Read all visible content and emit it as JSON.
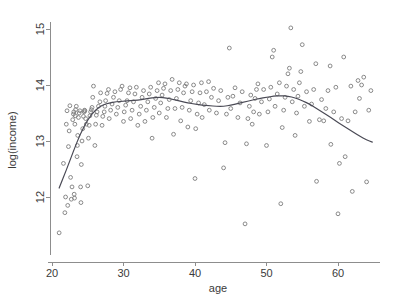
{
  "chart_data": {
    "type": "scatter",
    "title": "",
    "subtitle": "",
    "xlabel": "age",
    "ylabel": "log(income)",
    "xlim": [
      20,
      65
    ],
    "ylim": [
      11.3,
      15.2
    ],
    "xticks": [
      20,
      30,
      40,
      50,
      60
    ],
    "yticks": [
      12,
      13,
      14,
      15
    ],
    "xtick_labels": [
      "20",
      "30",
      "40",
      "50",
      "60"
    ],
    "ytick_labels": [
      "12",
      "13",
      "14",
      "15"
    ],
    "grid": false,
    "legend": null,
    "legend_position": "none",
    "marker": "open-circle",
    "marker_color": "#7d7d7d",
    "curve_color": "#4a4a55",
    "axis_color": "#8d8d8d",
    "background_color": "#ffffff",
    "annotations": [],
    "series": [
      {
        "name": "observations",
        "type": "scatter",
        "points": [
          [
            21.0,
            11.36
          ],
          [
            21.6,
            12.6
          ],
          [
            21.8,
            11.72
          ],
          [
            21.9,
            12.0
          ],
          [
            22.0,
            13.3
          ],
          [
            22.1,
            13.54
          ],
          [
            22.2,
            11.85
          ],
          [
            22.3,
            12.9
          ],
          [
            22.4,
            13.18
          ],
          [
            22.5,
            13.63
          ],
          [
            22.6,
            12.35
          ],
          [
            22.7,
            11.96
          ],
          [
            22.8,
            12.18
          ],
          [
            22.9,
            13.38
          ],
          [
            23.0,
            13.48
          ],
          [
            23.05,
            13.52
          ],
          [
            23.1,
            12.05
          ],
          [
            23.15,
            11.98
          ],
          [
            23.2,
            13.3
          ],
          [
            23.25,
            13.45
          ],
          [
            23.3,
            13.56
          ],
          [
            23.4,
            13.62
          ],
          [
            23.5,
            12.72
          ],
          [
            23.55,
            12.92
          ],
          [
            23.6,
            13.1
          ],
          [
            23.7,
            13.42
          ],
          [
            23.8,
            13.5
          ],
          [
            23.9,
            13.54
          ],
          [
            24.0,
            12.18
          ],
          [
            24.05,
            11.9
          ],
          [
            24.1,
            12.58
          ],
          [
            24.2,
            13.0
          ],
          [
            24.3,
            13.22
          ],
          [
            24.4,
            13.44
          ],
          [
            24.5,
            13.52
          ],
          [
            24.55,
            13.55
          ],
          [
            24.6,
            13.54
          ],
          [
            24.7,
            13.4
          ],
          [
            24.8,
            13.3
          ],
          [
            25.0,
            12.2
          ],
          [
            25.1,
            13.05
          ],
          [
            25.2,
            13.28
          ],
          [
            25.3,
            13.45
          ],
          [
            25.4,
            13.52
          ],
          [
            25.5,
            13.56
          ],
          [
            25.6,
            13.6
          ],
          [
            25.7,
            13.78
          ],
          [
            25.8,
            13.98
          ],
          [
            26.0,
            12.92
          ],
          [
            26.1,
            13.3
          ],
          [
            26.2,
            13.46
          ],
          [
            26.3,
            13.52
          ],
          [
            26.5,
            13.62
          ],
          [
            26.7,
            13.7
          ],
          [
            26.8,
            13.86
          ],
          [
            27.0,
            13.28
          ],
          [
            27.1,
            13.44
          ],
          [
            27.3,
            13.52
          ],
          [
            27.4,
            13.62
          ],
          [
            27.5,
            13.72
          ],
          [
            27.7,
            13.85
          ],
          [
            27.9,
            13.92
          ],
          [
            28.0,
            13.4
          ],
          [
            28.2,
            13.55
          ],
          [
            28.4,
            13.66
          ],
          [
            28.6,
            13.78
          ],
          [
            28.8,
            13.88
          ],
          [
            29.0,
            13.48
          ],
          [
            29.2,
            13.6
          ],
          [
            29.4,
            13.72
          ],
          [
            29.6,
            13.92
          ],
          [
            29.8,
            13.98
          ],
          [
            30.0,
            13.35
          ],
          [
            30.1,
            13.52
          ],
          [
            30.3,
            13.64
          ],
          [
            30.5,
            13.72
          ],
          [
            30.7,
            13.86
          ],
          [
            30.9,
            13.95
          ],
          [
            31.0,
            13.4
          ],
          [
            31.2,
            13.55
          ],
          [
            31.4,
            13.7
          ],
          [
            31.6,
            13.84
          ],
          [
            31.8,
            13.96
          ],
          [
            32.0,
            13.28
          ],
          [
            32.2,
            13.48
          ],
          [
            32.4,
            13.62
          ],
          [
            32.6,
            13.78
          ],
          [
            32.8,
            13.9
          ],
          [
            33.0,
            13.35
          ],
          [
            33.2,
            13.55
          ],
          [
            33.4,
            13.7
          ],
          [
            33.6,
            13.84
          ],
          [
            33.8,
            13.96
          ],
          [
            34.0,
            13.05
          ],
          [
            34.1,
            13.42
          ],
          [
            34.3,
            13.6
          ],
          [
            34.5,
            13.76
          ],
          [
            34.7,
            13.9
          ],
          [
            34.9,
            14.04
          ],
          [
            35.0,
            13.5
          ],
          [
            35.2,
            13.68
          ],
          [
            35.4,
            13.82
          ],
          [
            35.6,
            13.94
          ],
          [
            35.8,
            14.02
          ],
          [
            36.0,
            13.42
          ],
          [
            36.2,
            13.58
          ],
          [
            36.4,
            13.74
          ],
          [
            36.6,
            13.9
          ],
          [
            36.8,
            14.1
          ],
          [
            37.0,
            13.12
          ],
          [
            37.2,
            13.58
          ],
          [
            37.4,
            13.76
          ],
          [
            37.6,
            13.92
          ],
          [
            37.8,
            14.04
          ],
          [
            38.0,
            13.36
          ],
          [
            38.2,
            13.6
          ],
          [
            38.4,
            13.86
          ],
          [
            38.6,
            13.98
          ],
          [
            38.8,
            14.02
          ],
          [
            39.0,
            13.25
          ],
          [
            39.2,
            13.55
          ],
          [
            39.4,
            13.72
          ],
          [
            39.6,
            13.88
          ],
          [
            39.8,
            14.0
          ],
          [
            40.0,
            12.33
          ],
          [
            40.1,
            13.22
          ],
          [
            40.3,
            13.48
          ],
          [
            40.5,
            13.68
          ],
          [
            40.7,
            13.86
          ],
          [
            40.9,
            14.04
          ],
          [
            41.0,
            13.42
          ],
          [
            41.3,
            13.65
          ],
          [
            41.6,
            13.88
          ],
          [
            41.9,
            14.06
          ],
          [
            42.0,
            13.55
          ],
          [
            42.3,
            13.78
          ],
          [
            42.6,
            13.94
          ],
          [
            43.0,
            13.5
          ],
          [
            43.3,
            13.72
          ],
          [
            43.6,
            13.9
          ],
          [
            44.0,
            12.52
          ],
          [
            44.2,
            12.97
          ],
          [
            44.4,
            13.48
          ],
          [
            44.6,
            13.78
          ],
          [
            44.8,
            14.66
          ],
          [
            45.0,
            13.58
          ],
          [
            45.3,
            13.8
          ],
          [
            45.6,
            13.95
          ],
          [
            46.0,
            13.42
          ],
          [
            46.3,
            13.68
          ],
          [
            46.6,
            13.88
          ],
          [
            47.0,
            11.52
          ],
          [
            47.2,
            12.95
          ],
          [
            47.4,
            13.4
          ],
          [
            47.6,
            13.62
          ],
          [
            47.8,
            13.82
          ],
          [
            48.0,
            13.3
          ],
          [
            48.2,
            13.52
          ],
          [
            48.4,
            13.76
          ],
          [
            48.6,
            13.92
          ],
          [
            48.8,
            14.02
          ],
          [
            49.0,
            13.48
          ],
          [
            49.3,
            13.7
          ],
          [
            49.6,
            13.92
          ],
          [
            50.0,
            12.92
          ],
          [
            50.2,
            13.52
          ],
          [
            50.4,
            13.75
          ],
          [
            50.6,
            13.96
          ],
          [
            50.8,
            14.5
          ],
          [
            51.0,
            14.62
          ],
          [
            51.2,
            13.62
          ],
          [
            51.5,
            13.84
          ],
          [
            51.8,
            14.04
          ],
          [
            52.0,
            11.88
          ],
          [
            52.2,
            13.24
          ],
          [
            52.4,
            13.55
          ],
          [
            52.6,
            13.78
          ],
          [
            52.8,
            13.98
          ],
          [
            53.0,
            14.2
          ],
          [
            53.2,
            14.3
          ],
          [
            53.4,
            15.02
          ],
          [
            53.6,
            13.7
          ],
          [
            53.8,
            13.92
          ],
          [
            54.0,
            13.1
          ],
          [
            54.2,
            13.5
          ],
          [
            54.4,
            13.8
          ],
          [
            54.6,
            14.04
          ],
          [
            54.8,
            14.24
          ],
          [
            55.0,
            14.72
          ],
          [
            55.3,
            13.62
          ],
          [
            55.6,
            13.88
          ],
          [
            56.0,
            13.35
          ],
          [
            56.3,
            13.66
          ],
          [
            56.6,
            13.92
          ],
          [
            56.9,
            14.38
          ],
          [
            57.0,
            12.28
          ],
          [
            57.4,
            13.38
          ],
          [
            57.7,
            13.74
          ],
          [
            58.0,
            13.36
          ],
          [
            58.3,
            13.58
          ],
          [
            58.6,
            13.9
          ],
          [
            58.9,
            14.34
          ],
          [
            59.0,
            12.94
          ],
          [
            59.4,
            13.52
          ],
          [
            59.7,
            13.96
          ],
          [
            60.0,
            11.7
          ],
          [
            60.2,
            12.6
          ],
          [
            60.5,
            13.4
          ],
          [
            60.8,
            14.5
          ],
          [
            61.0,
            12.72
          ],
          [
            61.4,
            13.36
          ],
          [
            61.8,
            13.98
          ],
          [
            62.0,
            12.1
          ],
          [
            62.4,
            13.52
          ],
          [
            62.8,
            14.08
          ],
          [
            63.0,
            13.76
          ],
          [
            63.3,
            14.0
          ],
          [
            63.6,
            14.14
          ],
          [
            64.0,
            12.27
          ],
          [
            64.3,
            13.55
          ],
          [
            64.6,
            13.9
          ]
        ]
      },
      {
        "name": "loess-smooth",
        "type": "line",
        "points": [
          [
            21.0,
            12.16
          ],
          [
            22.0,
            12.48
          ],
          [
            23.0,
            12.82
          ],
          [
            24.0,
            13.14
          ],
          [
            25.0,
            13.38
          ],
          [
            26.0,
            13.55
          ],
          [
            27.0,
            13.64
          ],
          [
            28.0,
            13.68
          ],
          [
            29.0,
            13.7
          ],
          [
            30.0,
            13.71
          ],
          [
            31.0,
            13.72
          ],
          [
            32.0,
            13.73
          ],
          [
            33.0,
            13.75
          ],
          [
            34.0,
            13.77
          ],
          [
            35.0,
            13.78
          ],
          [
            36.0,
            13.77
          ],
          [
            37.0,
            13.74
          ],
          [
            38.0,
            13.71
          ],
          [
            39.0,
            13.68
          ],
          [
            40.0,
            13.66
          ],
          [
            41.0,
            13.64
          ],
          [
            42.0,
            13.63
          ],
          [
            43.0,
            13.62
          ],
          [
            44.0,
            13.62
          ],
          [
            45.0,
            13.64
          ],
          [
            46.0,
            13.67
          ],
          [
            47.0,
            13.7
          ],
          [
            48.0,
            13.73
          ],
          [
            49.0,
            13.76
          ],
          [
            50.0,
            13.78
          ],
          [
            51.0,
            13.8
          ],
          [
            52.0,
            13.81
          ],
          [
            53.0,
            13.8
          ],
          [
            54.0,
            13.77
          ],
          [
            55.0,
            13.72
          ],
          [
            56.0,
            13.66
          ],
          [
            57.0,
            13.58
          ],
          [
            58.0,
            13.5
          ],
          [
            59.0,
            13.42
          ],
          [
            60.0,
            13.33
          ],
          [
            61.0,
            13.25
          ],
          [
            62.0,
            13.17
          ],
          [
            63.0,
            13.09
          ],
          [
            64.0,
            13.02
          ],
          [
            64.8,
            12.98
          ]
        ]
      }
    ]
  }
}
